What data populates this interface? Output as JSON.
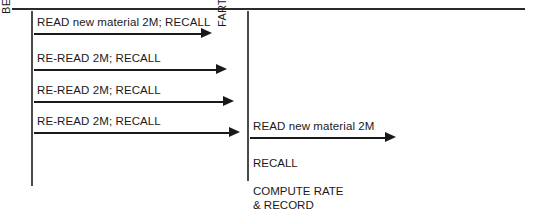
{
  "figure": {
    "labels": {
      "beginning": "BEGINNING READING POINT",
      "farthest": "FARTHEST READING POINT"
    },
    "left_passes": [
      {
        "caption": "READ new material 2M; RECALL",
        "shaft_width": 167,
        "head_left": 168
      },
      {
        "caption": "RE-READ 2M; RECALL",
        "shaft_width": 182,
        "head_left": 183
      },
      {
        "caption": "RE-READ 2M; RECALL",
        "shaft_width": 189,
        "head_left": 190
      },
      {
        "caption": "RE-READ 2M; RECALL",
        "shaft_width": 195,
        "head_left": 196
      }
    ],
    "right_stage": {
      "arrow": {
        "caption": "READ new material 2M",
        "shaft_width": 135,
        "head_left": 136
      },
      "recall": "RECALL",
      "compute_line1": "COMPUTE RATE",
      "compute_line2": "& RECORD"
    },
    "colors": {
      "ink": "#1a1a1a",
      "rule": "#2b2b2b",
      "background": "#ffffff"
    }
  }
}
